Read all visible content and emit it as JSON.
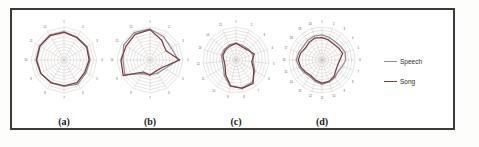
{
  "figure": {
    "panels": [
      {
        "id": "a",
        "caption": "(a)"
      },
      {
        "id": "b",
        "caption": "(b)"
      },
      {
        "id": "c",
        "caption": "(c)"
      },
      {
        "id": "d",
        "caption": "(d)"
      }
    ]
  },
  "legend": {
    "position": "right",
    "items": [
      {
        "label": "Speech",
        "color": "#8a8f99",
        "marker": "line"
      },
      {
        "label": "Song",
        "color": "#7d3a3a",
        "marker": "line"
      }
    ]
  },
  "chart_data": [
    {
      "type": "radar",
      "panel": "(a)",
      "title": "",
      "categories": [
        "1",
        "2",
        "3",
        "4",
        "5",
        "6",
        "7",
        "8",
        "9",
        "10",
        "11",
        "12"
      ],
      "rmax": 10,
      "rticks": 10,
      "grid": true,
      "legend_position": "external-right",
      "series": [
        {
          "name": "Speech",
          "color": "#8a8f99",
          "values": [
            8.6,
            8.0,
            8.1,
            7.9,
            7.7,
            8.4,
            8.0,
            8.0,
            8.2,
            8.5,
            8.6,
            8.7
          ]
        },
        {
          "name": "Song",
          "color": "#7d3a3a",
          "values": [
            8.4,
            7.8,
            7.9,
            7.6,
            7.3,
            7.9,
            7.8,
            7.9,
            8.1,
            8.3,
            8.4,
            8.5
          ]
        }
      ]
    },
    {
      "type": "radar",
      "panel": "(b)",
      "title": "",
      "categories": [
        "1",
        "2",
        "3",
        "4",
        "5",
        "6",
        "7",
        "8",
        "9",
        "10",
        "11",
        "12"
      ],
      "rmax": 10,
      "rticks": 10,
      "grid": true,
      "legend_position": "external-right",
      "series": [
        {
          "name": "Speech",
          "color": "#8a8f99",
          "values": [
            9.4,
            8.2,
            7.4,
            8.6,
            5.2,
            4.6,
            4.4,
            4.8,
            8.8,
            8.2,
            9.2,
            9.6
          ]
        },
        {
          "name": "Song",
          "color": "#7d3a3a",
          "values": [
            9.2,
            7.0,
            5.6,
            9.0,
            4.4,
            3.8,
            4.6,
            4.2,
            9.4,
            8.8,
            8.4,
            9.0
          ]
        }
      ]
    },
    {
      "type": "radar",
      "panel": "(c)",
      "title": "",
      "categories": [
        "1",
        "2",
        "3",
        "4",
        "5",
        "6",
        "7",
        "8",
        "9",
        "10",
        "11",
        "12",
        "13",
        "14",
        "15"
      ],
      "rmax": 10,
      "rticks": 10,
      "grid": true,
      "legend_position": "external-right",
      "series": [
        {
          "name": "Speech",
          "color": "#8a8f99",
          "values": [
            5.2,
            4.8,
            5.0,
            5.4,
            5.2,
            6.6,
            8.4,
            8.6,
            8.2,
            6.0,
            4.4,
            4.2,
            4.6,
            4.8,
            5.0
          ]
        },
        {
          "name": "Song",
          "color": "#7d3a3a",
          "values": [
            5.0,
            4.4,
            4.6,
            5.8,
            4.8,
            6.2,
            8.8,
            8.8,
            8.0,
            5.4,
            3.8,
            3.6,
            4.2,
            4.4,
            4.6
          ]
        }
      ]
    },
    {
      "type": "radar",
      "panel": "(d)",
      "title": "",
      "categories": [
        "1",
        "2",
        "3",
        "4",
        "5",
        "6",
        "7",
        "8",
        "9",
        "10",
        "11",
        "12",
        "13",
        "14",
        "15",
        "16",
        "17",
        "18",
        "19",
        "20"
      ],
      "rmax": 10,
      "rticks": 10,
      "grid": true,
      "legend_position": "external-right",
      "series": [
        {
          "name": "Speech",
          "color": "#8a8f99",
          "values": [
            7.6,
            7.2,
            6.8,
            7.0,
            7.4,
            7.2,
            6.4,
            6.0,
            6.6,
            7.0,
            7.4,
            6.8,
            6.2,
            6.6,
            7.2,
            7.8,
            7.4,
            7.0,
            7.4,
            7.6
          ]
        },
        {
          "name": "Song",
          "color": "#7d3a3a",
          "values": [
            6.8,
            6.4,
            6.0,
            6.2,
            6.6,
            5.4,
            5.0,
            5.2,
            6.2,
            6.8,
            7.0,
            6.4,
            5.8,
            6.2,
            6.8,
            7.2,
            6.8,
            6.2,
            6.6,
            7.0
          ]
        }
      ]
    }
  ]
}
